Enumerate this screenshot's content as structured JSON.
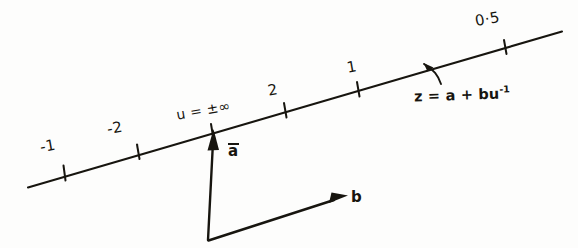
{
  "figure": {
    "background_color": "#fdfdfc",
    "ink_color": "#17150f",
    "style": "hand-drawn scanned line figure"
  },
  "axis_line": {
    "name": "parametric-line",
    "description": "straight line sloping up to the right",
    "start": {
      "x": 28,
      "y": 187
    },
    "end": {
      "x": 562,
      "y": 32
    },
    "slope_degrees": -16.2
  },
  "tick_labels": [
    {
      "id": "minus-one",
      "text": "-1",
      "tick": {
        "x": 64,
        "y": 172
      }
    },
    {
      "id": "minus-two",
      "text": "-2",
      "tick": {
        "x": 138,
        "y": 151
      }
    },
    {
      "id": "u-infinity",
      "text": "u = ±∞",
      "tick": {
        "x": 212,
        "y": 130
      }
    },
    {
      "id": "two",
      "text": "2",
      "tick": {
        "x": 285,
        "y": 109
      }
    },
    {
      "id": "one",
      "text": "1",
      "tick": {
        "x": 358,
        "y": 88
      }
    },
    {
      "id": "zero-five",
      "text": "0·5",
      "tick": {
        "x": 505,
        "y": 46
      }
    }
  ],
  "annotations": {
    "equation": "z = a + bu",
    "equation_exponent": "-1",
    "equation_full": "z = a + bu⁻¹"
  },
  "vectors": [
    {
      "id": "vector-a",
      "label": "a",
      "has_overbar": true,
      "origin": {
        "x": 208,
        "y": 241
      },
      "tip": {
        "x": 212,
        "y": 132
      }
    },
    {
      "id": "vector-b",
      "label": "b",
      "has_overbar": false,
      "origin": {
        "x": 208,
        "y": 241
      },
      "tip": {
        "x": 348,
        "y": 196
      }
    }
  ]
}
